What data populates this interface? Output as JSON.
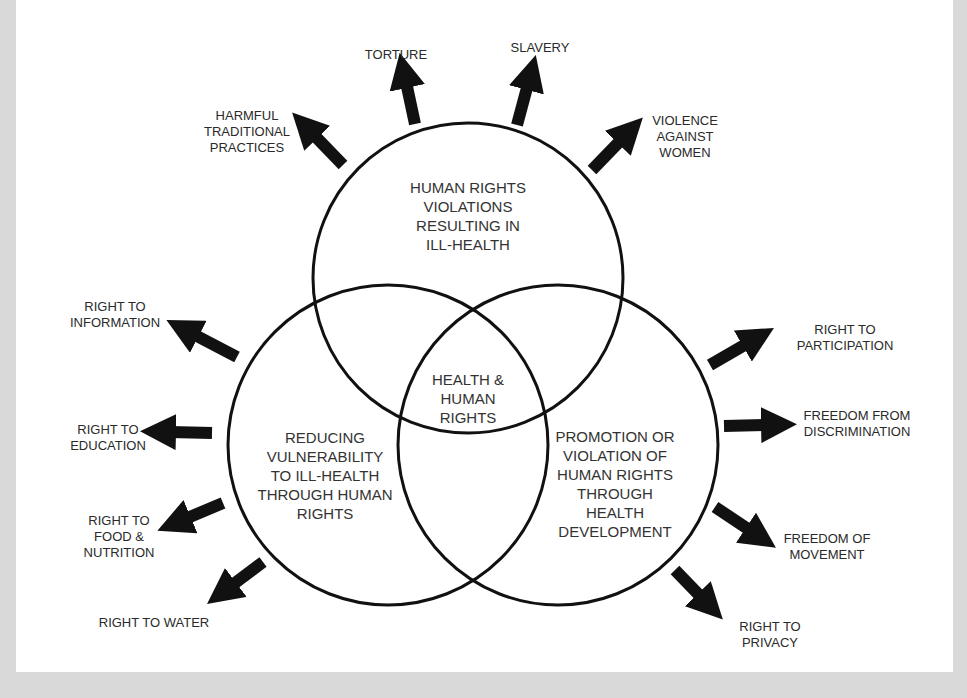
{
  "colors": {
    "background": "#d9d9d9",
    "panel": "#ffffff",
    "ink": "#111111",
    "text": "#2a2a2a"
  },
  "circles": {
    "top": {
      "label": "HUMAN RIGHTS\nVIOLATIONS\nRESULTING IN\nILL-HEALTH",
      "cx": 468,
      "cy": 278,
      "r": 155
    },
    "left": {
      "label": "REDUCING\nVULNERABILITY\nTO ILL-HEALTH\nTHROUGH HUMAN\nRIGHTS",
      "cx": 388,
      "cy": 445,
      "r": 160
    },
    "right": {
      "label": "PROMOTION OR\nVIOLATION OF\nHUMAN RIGHTS\nTHROUGH\nHEALTH\nDEVELOPMENT",
      "cx": 558,
      "cy": 445,
      "r": 160
    },
    "center": {
      "label": "HEALTH &\nHUMAN\nRIGHTS"
    }
  },
  "arrows": [
    {
      "id": "torture",
      "label": "TORTURE"
    },
    {
      "id": "slavery",
      "label": "SLAVERY"
    },
    {
      "id": "harmful",
      "label": "HARMFUL\nTRADITIONAL\nPRACTICES"
    },
    {
      "id": "violence",
      "label": "VIOLENCE\nAGAINST\nWOMEN"
    },
    {
      "id": "information",
      "label": "RIGHT TO\nINFORMATION"
    },
    {
      "id": "education",
      "label": "RIGHT TO\nEDUCATION"
    },
    {
      "id": "food",
      "label": "RIGHT TO\nFOOD &\nNUTRITION"
    },
    {
      "id": "water",
      "label": "RIGHT TO WATER"
    },
    {
      "id": "participation",
      "label": "RIGHT TO\nPARTICIPATION"
    },
    {
      "id": "discrimination",
      "label": "FREEDOM FROM\nDISCRIMINATION"
    },
    {
      "id": "movement",
      "label": "FREEDOM OF\nMOVEMENT"
    },
    {
      "id": "privacy",
      "label": "RIGHT TO\nPRIVACY"
    }
  ]
}
